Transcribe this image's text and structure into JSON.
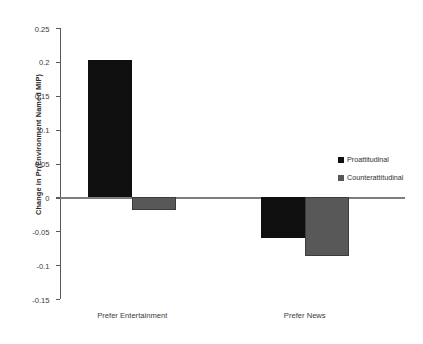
{
  "chart_data": {
    "type": "bar",
    "title": "",
    "xlabel": "",
    "ylabel": "Change in Pr(Environment Named MIP)",
    "categories": [
      "Prefer Entertainment",
      "Prefer News"
    ],
    "series": [
      {
        "name": "Proattitudinal",
        "color": "#0f0f0f",
        "values": [
          0.203,
          -0.06
        ]
      },
      {
        "name": "Counterattitudinal",
        "color": "#585858",
        "values": [
          -0.018,
          -0.086
        ]
      }
    ],
    "ylim": [
      -0.15,
      0.25
    ],
    "ytick_labels": [
      "0.25",
      "0.2",
      "0.15",
      "0.1",
      "0.05",
      "0",
      "-0.05",
      "-0.1",
      "-0.15"
    ],
    "ytick_values": [
      0.25,
      0.2,
      0.15,
      0.1,
      0.05,
      0,
      -0.05,
      -0.1,
      -0.15
    ],
    "grid": false,
    "legend_position": "right",
    "zero_line": true
  },
  "legend": {
    "entries": [
      {
        "label": "Proattitudinal"
      },
      {
        "label": "Counterattitudinal"
      }
    ]
  }
}
